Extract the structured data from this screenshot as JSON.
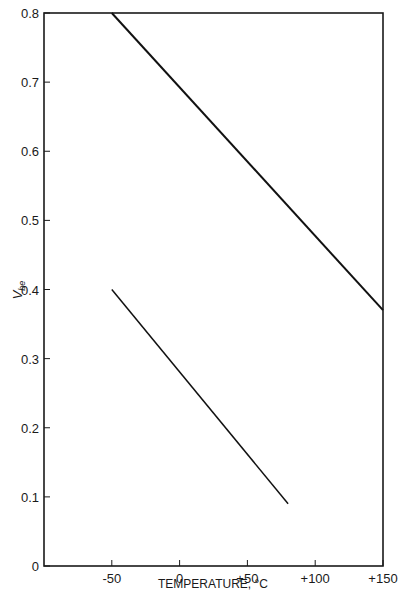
{
  "chart_data": {
    "type": "line",
    "title": "",
    "xlabel": "TEMPERATURE, °C",
    "ylabel": "V_be",
    "ylabel_main": "V",
    "ylabel_sub": "be",
    "xlim": [
      -100,
      150
    ],
    "ylim": [
      0,
      0.8
    ],
    "grid": false,
    "legend": "none",
    "x_ticks": [
      -50,
      0,
      50,
      100,
      150
    ],
    "x_tick_labels": [
      "-50",
      "0",
      "+50",
      "+100",
      "+150"
    ],
    "y_ticks": [
      0,
      0.1,
      0.2,
      0.3,
      0.4,
      0.5,
      0.6,
      0.7,
      0.8
    ],
    "y_tick_labels": [
      "0",
      "0.1",
      "0.2",
      "0.3",
      "0.4",
      "0.5",
      "0.6",
      "0.7",
      "0.8"
    ],
    "series": [
      {
        "name": "upper line",
        "x": [
          -50,
          150
        ],
        "y": [
          0.8,
          0.37
        ],
        "stroke_width": 2
      },
      {
        "name": "lower line",
        "x": [
          -50,
          80
        ],
        "y": [
          0.4,
          0.09
        ],
        "stroke_width": 1.5
      }
    ]
  }
}
